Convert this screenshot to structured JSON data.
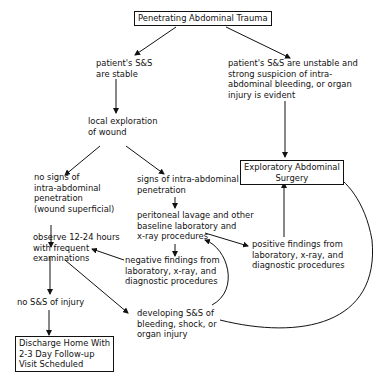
{
  "diagram": {
    "nodes": {
      "root": "Penetrating Abdominal Trauma",
      "stable": "patient's S&S\nare stable",
      "unstable": "patient's S&S are unstable and\nstrong suspicion of intra-\nabdominal bleeding, or organ\ninjury is evident",
      "local_exploration": "local exploration\nof wound",
      "surgery": "Exploratory Abdominal\nSurgery",
      "no_signs": "no signs of\nintra-abdominal\npenetration\n(wound superficial)",
      "signs": "signs of intra-abdominal\npenetration",
      "lavage": "peritoneal lavage and other\nbaseline laboratory and\nx-ray procedures",
      "observe": "observe 12-24 hours\nwith frequent\nexaminations",
      "positive": "positive findings from\nlaboratory, x-ray, and\ndiagnostic procedures",
      "negative": "negative findings from\nlaboratory, x-ray, and\ndiagnostic procedures",
      "no_injury": "no S&S of injury",
      "developing": "developing S&S of\nbleeding, shock, or\norgan injury",
      "discharge": "Discharge Home With\n2-3 Day Follow-up\nVisit Scheduled"
    },
    "edges": [
      [
        "root",
        "stable"
      ],
      [
        "root",
        "unstable"
      ],
      [
        "stable",
        "local_exploration"
      ],
      [
        "unstable",
        "surgery"
      ],
      [
        "local_exploration",
        "no_signs"
      ],
      [
        "local_exploration",
        "signs"
      ],
      [
        "signs",
        "lavage"
      ],
      [
        "no_signs",
        "observe"
      ],
      [
        "lavage",
        "negative"
      ],
      [
        "lavage",
        "positive"
      ],
      [
        "positive",
        "surgery"
      ],
      [
        "negative",
        "observe"
      ],
      [
        "observe",
        "no_injury"
      ],
      [
        "observe",
        "developing"
      ],
      [
        "no_injury",
        "discharge"
      ],
      [
        "developing",
        "lavage"
      ],
      [
        "developing",
        "surgery"
      ]
    ]
  }
}
